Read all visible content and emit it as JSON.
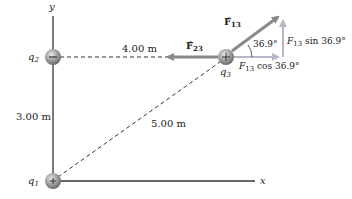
{
  "axes": {
    "x_label": "x",
    "y_label": "y"
  },
  "charges": {
    "q1": {
      "label": "q",
      "sub": "1",
      "sign": "+"
    },
    "q2": {
      "label": "q",
      "sub": "2",
      "sign": "−"
    },
    "q3": {
      "label": "q",
      "sub": "3",
      "sign": "+"
    }
  },
  "distances": {
    "q2_q3": "4.00 m",
    "q1_q2": "3.00 m",
    "q1_q3": "5.00 m"
  },
  "forces": {
    "F23": {
      "label": "F",
      "sub": "23"
    },
    "F13": {
      "label": "F",
      "sub": "13"
    },
    "F13_sin": {
      "prefix": "F",
      "sub": "13",
      "suffix": " sin 36.9°"
    },
    "F13_cos": {
      "prefix": "F",
      "sub": "13",
      "suffix": " cos 36.9°"
    }
  },
  "angle": "36.9°",
  "colors": {
    "force": "#8a8a8a",
    "component": "#b6b6c8",
    "axis": "#333333",
    "charge": "#9a9a9a"
  }
}
